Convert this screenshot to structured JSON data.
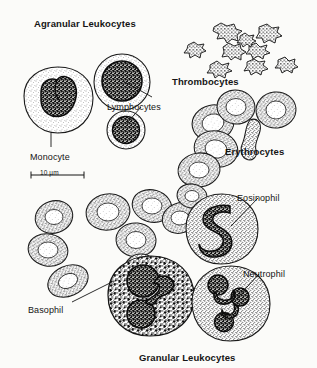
{
  "figure": {
    "title_top": "Agranular Leukocytes",
    "title_bottom": "Granular Leukocytes",
    "scale_bar_label": "10 µm",
    "background_color": "#fbfbf9",
    "ink_color": "#151515",
    "style": "stippled line drawing / scanned textbook plate"
  },
  "labels": {
    "agranular_leukocytes": "Agranular Leukocytes",
    "thrombocytes": "Thrombocytes",
    "lymphocytes": "Lymphocytes",
    "monocyte": "Monocyte",
    "erythrocytes": "Erythrocytes",
    "eosinophil": "Eosinophil",
    "neutrophil": "Neutrophil",
    "basophil": "Basophil",
    "granular_leukocytes": "Granular Leukocytes",
    "scale": "10 µm"
  },
  "label_positions": {
    "agranular_leukocytes": {
      "x": 34,
      "y": 18,
      "bold": true
    },
    "thrombocytes": {
      "x": 172,
      "y": 76,
      "bold": true
    },
    "lymphocytes": {
      "x": 107,
      "y": 102,
      "bold": false
    },
    "monocyte": {
      "x": 30,
      "y": 152,
      "bold": false
    },
    "scale": {
      "x": 33,
      "y": 168,
      "bold": false
    },
    "erythrocytes": {
      "x": 225,
      "y": 146,
      "bold": true
    },
    "eosinophil": {
      "x": 237,
      "y": 193,
      "bold": false
    },
    "neutrophil": {
      "x": 243,
      "y": 269,
      "bold": false
    },
    "basophil": {
      "x": 28,
      "y": 305,
      "bold": false
    },
    "granular_leukocytes": {
      "x": 139,
      "y": 352,
      "bold": true
    }
  },
  "cell_types": [
    {
      "name": "Monocyte",
      "group": "Agranular Leukocytes",
      "count_shown": 1,
      "description": "Large pale cell with kidney-shaped / bilobed dark nucleus and finely stippled cytoplasm"
    },
    {
      "name": "Lymphocytes",
      "group": "Agranular Leukocytes",
      "count_shown": 2,
      "description": "Round cells with very large dark round nucleus and thin rim of cytoplasm"
    },
    {
      "name": "Thrombocytes",
      "group": "Platelets",
      "count_shown": 9,
      "description": "Small irregular spiky star-shaped cell fragments"
    },
    {
      "name": "Erythrocytes",
      "group": "Red blood cells",
      "count_shown": 16,
      "description": "Biconcave discs with pale central depression; one shown edge-on as a dumbbell profile"
    },
    {
      "name": "Eosinophil",
      "group": "Granular Leukocytes",
      "count_shown": 1,
      "description": "Cell with bilobed S-shaped nucleus and coarse stippled granules"
    },
    {
      "name": "Basophil",
      "group": "Granular Leukocytes",
      "count_shown": 1,
      "description": "Cell packed with large dark irregular granules obscuring a bilobed nucleus"
    },
    {
      "name": "Neutrophil",
      "group": "Granular Leukocytes",
      "count_shown": 1,
      "description": "Cell with dark multilobed (3-4 lobe) nucleus and fine granular cytoplasm"
    }
  ],
  "leader_lines": [
    {
      "from": "lymphocytes-label",
      "to": "lymphocyte-upper",
      "x1": 152,
      "y1": 98,
      "x2": 122,
      "y2": 82
    },
    {
      "from": "lymphocytes-label",
      "to": "lymphocyte-lower",
      "x1": 141,
      "y1": 108,
      "x2": 126,
      "y2": 123
    },
    {
      "from": "monocyte-label",
      "to": "monocyte-cell",
      "x1": 51,
      "y1": 146,
      "x2": 51,
      "y2": 134
    },
    {
      "from": "eosinophil-label",
      "to": "eosinophil-cell",
      "x1": 257,
      "y1": 198,
      "x2": 232,
      "y2": 224
    },
    {
      "from": "neutrophil-label",
      "to": "neutrophil-cell",
      "x1": 258,
      "y1": 274,
      "x2": 237,
      "y2": 298
    },
    {
      "from": "basophil-label",
      "to": "basophil-cell",
      "x1": 71,
      "y1": 302,
      "x2": 113,
      "y2": 281
    }
  ],
  "scale_bar": {
    "x1": 31,
    "x2": 84,
    "y": 175,
    "label": "10 µm"
  }
}
